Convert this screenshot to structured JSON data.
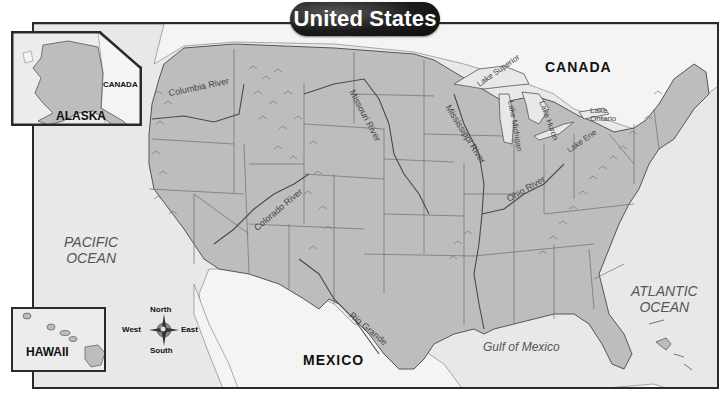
{
  "title": "United States",
  "labels": {
    "canada": "CANADA",
    "mexico": "MEXICO",
    "pacific_ocean_line1": "PACIFIC",
    "pacific_ocean_line2": "OCEAN",
    "atlantic_ocean_line1": "ATLANTIC",
    "atlantic_ocean_line2": "OCEAN",
    "gulf_of_mexico": "Gulf of Mexico"
  },
  "rivers": {
    "columbia": "Columbia River",
    "missouri": "Missouri River",
    "mississippi": "Mississippi River",
    "ohio": "Ohio River",
    "colorado": "Colorado River",
    "rio_grande": "Rio Grande"
  },
  "lakes": {
    "superior": "Lake Superior",
    "michigan": "Lake Michigan",
    "huron": "Lake Huron",
    "erie": "Lake Erie",
    "ontario_line1": "Lake",
    "ontario_line2": "Ontario"
  },
  "insets": {
    "alaska": {
      "label": "ALASKA",
      "neighbor": "CANADA"
    },
    "hawaii": {
      "label": "HAWAII"
    }
  },
  "compass": {
    "north": "North",
    "south": "South",
    "east": "East",
    "west": "West"
  },
  "colors": {
    "land_us": "#bdbdbd",
    "land_other": "#f2f2f2",
    "water": "#e6e6e6",
    "border": "#2a2a2a",
    "title_bg": "#1c1c1c",
    "title_text": "#ffffff"
  }
}
